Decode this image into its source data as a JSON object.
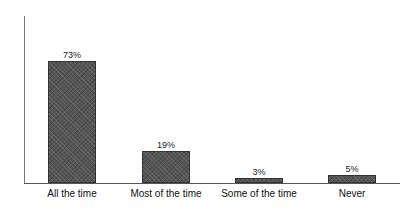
{
  "chart_data": {
    "type": "bar",
    "title": "",
    "xlabel": "",
    "ylabel": "",
    "categories": [
      "All the time",
      "Most of the time",
      "Some of the time",
      "Never"
    ],
    "values": [
      73,
      19,
      3,
      5
    ],
    "value_labels": [
      "73%",
      "19%",
      "3%",
      "5%"
    ],
    "ylim": [
      0,
      100
    ],
    "grid": false,
    "legend": null,
    "bar_color": "#555555"
  }
}
